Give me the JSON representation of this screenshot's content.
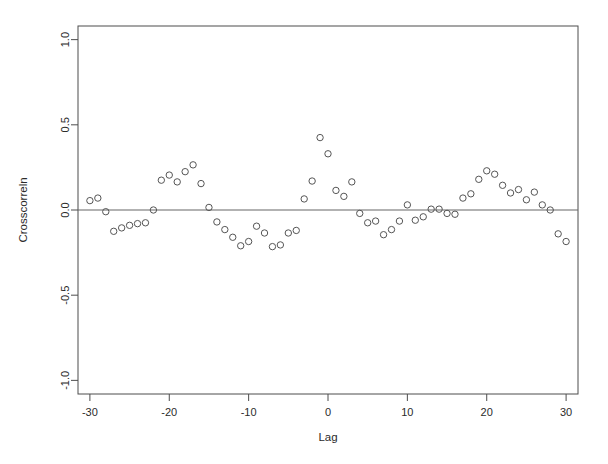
{
  "chart_data": {
    "type": "scatter",
    "title": "",
    "xlabel": "Lag",
    "ylabel": "Crosscorreln",
    "xlim": [
      -31.5,
      31.5
    ],
    "ylim": [
      -1.08,
      1.08
    ],
    "grid": false,
    "legend": null,
    "xticks": [
      -30,
      -20,
      -10,
      0,
      10,
      20,
      30
    ],
    "xtick_labels": [
      "-30",
      "-20",
      "-10",
      "0",
      "10",
      "20",
      "30"
    ],
    "yticks": [
      -1.0,
      -0.5,
      0.0,
      0.5,
      1.0
    ],
    "ytick_labels": [
      "-1.0",
      "-0.5",
      "0.0",
      "0.5",
      "1.0"
    ],
    "reference_line_y": 0.0,
    "marker": "open-circle",
    "marker_size": 3.2,
    "marker_color": "#555555",
    "x": [
      -30,
      -29,
      -28,
      -27,
      -26,
      -25,
      -24,
      -23,
      -22,
      -21,
      -20,
      -19,
      -18,
      -17,
      -16,
      -15,
      -14,
      -13,
      -12,
      -11,
      -10,
      -9,
      -8,
      -7,
      -6,
      -5,
      -4,
      -3,
      -2,
      -1,
      0,
      1,
      2,
      3,
      4,
      5,
      6,
      7,
      8,
      9,
      10,
      11,
      12,
      13,
      14,
      15,
      16,
      17,
      18,
      19,
      20,
      21,
      22,
      23,
      24,
      25,
      26,
      27,
      28,
      29,
      30
    ],
    "y": [
      0.055,
      0.07,
      -0.01,
      -0.125,
      -0.105,
      -0.09,
      -0.08,
      -0.075,
      0.0,
      0.175,
      0.205,
      0.165,
      0.225,
      0.265,
      0.155,
      0.015,
      -0.07,
      -0.115,
      -0.16,
      -0.21,
      -0.185,
      -0.095,
      -0.135,
      -0.215,
      -0.205,
      -0.135,
      -0.12,
      0.065,
      0.17,
      0.425,
      0.33,
      0.115,
      0.08,
      0.165,
      -0.02,
      -0.075,
      -0.065,
      -0.145,
      -0.115,
      -0.065,
      0.03,
      -0.06,
      -0.04,
      0.005,
      0.005,
      -0.02,
      -0.025,
      0.07,
      0.095,
      0.18,
      0.23,
      0.21,
      0.145,
      0.1,
      0.12,
      0.06,
      0.105,
      0.03,
      0.0,
      -0.14,
      -0.185,
      -0.3
    ]
  }
}
